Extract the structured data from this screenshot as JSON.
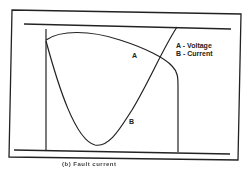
{
  "diagram": {
    "type": "waveform",
    "curves": [
      {
        "id": "A",
        "label": "A",
        "name": "Voltage"
      },
      {
        "id": "B",
        "label": "B",
        "name": "Current"
      }
    ],
    "legend": [
      "A - Voltage",
      "B - Current"
    ],
    "caption": "(b) Fault current"
  }
}
